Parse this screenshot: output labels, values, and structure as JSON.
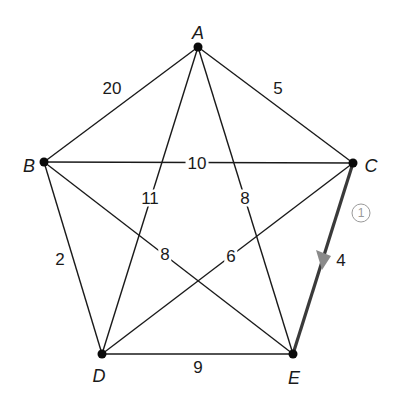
{
  "diagram": {
    "type": "weighted-graph",
    "colors": {
      "edge": "#1a1a1a",
      "highlight_edge": "#3a3a3a",
      "arrow": "#8a8a8a",
      "step_marker": "#9a9a9a",
      "node": "#0a0a0a"
    },
    "nodes": [
      {
        "id": "A",
        "label": "A",
        "x": 198,
        "y": 47
      },
      {
        "id": "B",
        "label": "B",
        "x": 44,
        "y": 162
      },
      {
        "id": "C",
        "label": "C",
        "x": 353,
        "y": 163
      },
      {
        "id": "D",
        "label": "D",
        "x": 102,
        "y": 354
      },
      {
        "id": "E",
        "label": "E",
        "x": 293,
        "y": 354
      }
    ],
    "edges": [
      {
        "from": "A",
        "to": "B",
        "weight": "20"
      },
      {
        "from": "A",
        "to": "C",
        "weight": "5"
      },
      {
        "from": "A",
        "to": "D",
        "weight": "11"
      },
      {
        "from": "A",
        "to": "E",
        "weight": "8"
      },
      {
        "from": "B",
        "to": "C",
        "weight": "10"
      },
      {
        "from": "B",
        "to": "D",
        "weight": "2"
      },
      {
        "from": "B",
        "to": "E",
        "weight": "8"
      },
      {
        "from": "C",
        "to": "D",
        "weight": "6"
      },
      {
        "from": "C",
        "to": "E",
        "weight": "4",
        "highlighted": true,
        "direction": "C->E",
        "step": "1"
      },
      {
        "from": "D",
        "to": "E",
        "weight": "9"
      }
    ],
    "step_marker": "1"
  }
}
